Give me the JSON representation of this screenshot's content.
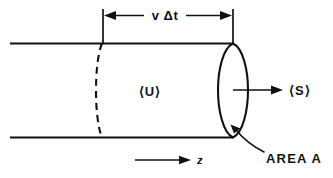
{
  "figure": {
    "kind": "physics-diagram",
    "background_color": "#ffffff",
    "ink_color": "#111111",
    "labels": {
      "dimension": "v Δt",
      "energy_density": "⟨U⟩",
      "flux": "⟨S⟩",
      "axis": "z",
      "area": "AREA  A"
    },
    "annotations": {
      "dimension_line": {
        "name": "v-delta-t-dimension",
        "from_x": 102,
        "to_x": 233,
        "y": 15,
        "double_headed": true
      },
      "z_axis_arrow": {
        "name": "z-axis-arrow",
        "from_x": 135,
        "to_x": 190,
        "y": 160
      },
      "flux_arrow": {
        "name": "flux-arrow",
        "from_x": 233,
        "to_x": 282,
        "y": 90
      },
      "area_leader": {
        "name": "area-leader-line",
        "tip_x": 231,
        "tip_y": 126
      }
    },
    "geometry": {
      "tube_top_y": 43,
      "tube_bottom_y": 138,
      "tube_left_x": 10,
      "cap_center_x": 233,
      "cap_half_width": 15,
      "back_cap_center_x": 102,
      "back_cap_half_width": 8
    }
  }
}
